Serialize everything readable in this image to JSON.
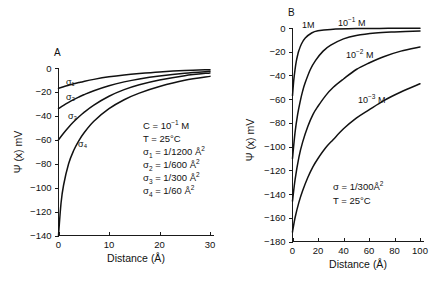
{
  "figure": {
    "background_color": "#ffffff",
    "line_color": "#111111"
  },
  "panel_a": {
    "letter": "A",
    "xlabel": "Distance (Å)",
    "ylabel": "Ψ (x) mV",
    "xticks": [
      "0",
      "10",
      "20",
      "30"
    ],
    "yticks": [
      "0",
      "−20",
      "−40",
      "−60",
      "−80",
      "−100",
      "−120",
      "−140"
    ],
    "curve_labels": [
      "σ₁",
      "σ₂",
      "σ₃",
      "σ₄"
    ],
    "annotation": {
      "line1_prefix": "C = 10",
      "line1_sup": "−1",
      "line1_suffix": " M",
      "line2": "T = 25°C",
      "line3_sub": "1",
      "line3_value": " = 1/1200 Å",
      "line3_sup": "2",
      "line4_sub": "2",
      "line4_value": " = 1/600 Å",
      "line4_sup": "2",
      "line5_sub": "3",
      "line5_value": " = 1/300 Å",
      "line5_sup": "2",
      "line6_sub": "4",
      "line6_value": " = 1/60 Å",
      "line6_sup": "2",
      "sigma": "σ"
    }
  },
  "panel_b": {
    "letter": "B",
    "xlabel": "Distance (Å)",
    "ylabel": "Ψ (x) mV",
    "xticks": [
      "0",
      "20",
      "40",
      "60",
      "80",
      "100"
    ],
    "yticks": [
      "0",
      "−20",
      "−40",
      "−60",
      "−80",
      "−100",
      "−120",
      "−140",
      "−160",
      "−180"
    ],
    "curve_labels": [
      {
        "prefix": "1M",
        "sup": "",
        "suffix": ""
      },
      {
        "prefix": "10",
        "sup": "−1",
        "suffix": " M"
      },
      {
        "prefix": "10",
        "sup": "−2",
        "suffix": " M"
      },
      {
        "prefix": "10",
        "sup": "−3",
        "suffix": " M"
      }
    ],
    "annotation": {
      "line1": "σ  =  1/300Å",
      "line1_sup": "2",
      "line2": "T  =  25°C"
    }
  },
  "chart_data": [
    {
      "type": "line",
      "title": "A",
      "xlabel": "Distance (Å)",
      "ylabel": "Ψ (x) mV",
      "xlim": [
        0,
        30
      ],
      "ylim": [
        -140,
        0
      ],
      "xticks": [
        0,
        10,
        20,
        30
      ],
      "yticks": [
        0,
        -20,
        -40,
        -60,
        -80,
        -100,
        -120,
        -140
      ],
      "grid": false,
      "legend": "inline-curve-labels",
      "conditions": {
        "C": "10^-1 M",
        "T": "25 C"
      },
      "series": [
        {
          "name": "σ₁ = 1/1200 Å²",
          "x": [
            0,
            1,
            2,
            3,
            4,
            5,
            7,
            10,
            13,
            16,
            20,
            25,
            30
          ],
          "y": [
            -17,
            -15.6,
            -14.4,
            -13.2,
            -12.2,
            -11.2,
            -9.5,
            -7.4,
            -5.8,
            -4.6,
            -3.3,
            -2.1,
            -1.4
          ]
        },
        {
          "name": "σ₂ = 1/600 Å²",
          "x": [
            0,
            1,
            2,
            3,
            4,
            5,
            7,
            10,
            13,
            16,
            20,
            25,
            30
          ],
          "y": [
            -34,
            -31.2,
            -28.7,
            -26.4,
            -24.3,
            -22.4,
            -19.0,
            -14.8,
            -11.6,
            -9.1,
            -6.6,
            -4.3,
            -2.8
          ]
        },
        {
          "name": "σ₃ = 1/300 Å²",
          "x": [
            0,
            1,
            2,
            3,
            4,
            5,
            7,
            10,
            13,
            16,
            20,
            25,
            30
          ],
          "y": [
            -60,
            -54.5,
            -49.5,
            -45.0,
            -41.0,
            -37.3,
            -31.0,
            -23.6,
            -18.1,
            -14.0,
            -10.0,
            -6.4,
            -4.1
          ]
        },
        {
          "name": "σ₄ = 1/60 Å²",
          "x": [
            0,
            0.5,
            1,
            2,
            3,
            4,
            5,
            7,
            10,
            13,
            16,
            20,
            25,
            30
          ],
          "y": [
            -140,
            -113,
            -98,
            -80,
            -69,
            -61,
            -54.5,
            -44.5,
            -34,
            -26.5,
            -21,
            -15.5,
            -10.3,
            -7.0
          ]
        }
      ]
    },
    {
      "type": "line",
      "title": "B",
      "xlabel": "Distance (Å)",
      "ylabel": "Ψ (x) mV",
      "xlim": [
        0,
        100
      ],
      "ylim": [
        -180,
        0
      ],
      "xticks": [
        0,
        20,
        40,
        60,
        80,
        100
      ],
      "yticks": [
        0,
        -20,
        -40,
        -60,
        -80,
        -100,
        -120,
        -140,
        -160,
        -180
      ],
      "grid": false,
      "legend": "inline-curve-labels",
      "conditions": {
        "sigma": "1/300 Å²",
        "T": "25 C"
      },
      "series": [
        {
          "name": "1M",
          "x": [
            0,
            1,
            2,
            3,
            4,
            5,
            7,
            10,
            15,
            20,
            30,
            50,
            75,
            100
          ],
          "y": [
            -57,
            -44,
            -35,
            -28,
            -23,
            -19,
            -13.5,
            -8.5,
            -4.2,
            -2.4,
            -1.2,
            -0.5,
            -0.3,
            -0.2
          ]
        },
        {
          "name": "10−1 M",
          "x": [
            0,
            2,
            4,
            6,
            8,
            10,
            14,
            18,
            24,
            30,
            40,
            50,
            65,
            80,
            100
          ],
          "y": [
            -110,
            -88,
            -73,
            -62,
            -53,
            -46,
            -35,
            -27.5,
            -19.5,
            -14.5,
            -9.2,
            -6.3,
            -4.2,
            -3.3,
            -2.6
          ]
        },
        {
          "name": "10−2 M",
          "x": [
            0,
            2,
            5,
            8,
            12,
            16,
            20,
            26,
            32,
            40,
            50,
            60,
            72,
            85,
            100
          ],
          "y": [
            -146,
            -128,
            -109,
            -96,
            -83,
            -73,
            -66,
            -57,
            -50,
            -43,
            -35,
            -29.5,
            -24,
            -19.5,
            -16
          ]
        },
        {
          "name": "10−3 M",
          "x": [
            0,
            2,
            5,
            8,
            12,
            16,
            20,
            26,
            32,
            40,
            50,
            60,
            72,
            85,
            100
          ],
          "y": [
            -172,
            -160,
            -147,
            -137,
            -126,
            -117,
            -110,
            -101,
            -94,
            -85,
            -76,
            -69,
            -61,
            -54,
            -47
          ]
        }
      ]
    }
  ]
}
